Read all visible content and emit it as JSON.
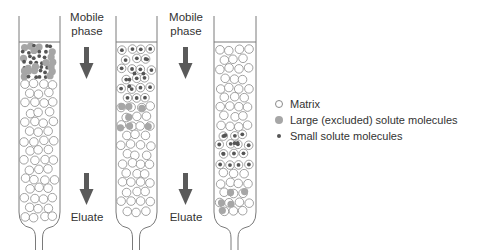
{
  "colors": {
    "outline": "#7a7a7a",
    "matrix_stroke": "#8a8a8a",
    "large_fill": "#a6a6a6",
    "small_fill": "#555555",
    "arrow": "#5a5a5a",
    "text": "#333333"
  },
  "arrows": [
    {
      "label": "Mobile phase",
      "label_lines": [
        "Mobile",
        "phase"
      ],
      "direction": "down",
      "position": "top"
    },
    {
      "label": "Eluate",
      "label_lines": [
        "Eluate"
      ],
      "direction": "down",
      "position": "bottom"
    },
    {
      "label": "Mobile phase",
      "label_lines": [
        "Mobile",
        "phase"
      ],
      "direction": "down",
      "position": "top"
    },
    {
      "label": "Eluate",
      "label_lines": [
        "Eluate"
      ],
      "direction": "down",
      "position": "bottom"
    }
  ],
  "columns": [
    {
      "stage": "sample applied",
      "bands": [
        {
          "type": "mixed",
          "contents": [
            "large",
            "small"
          ],
          "location": "top"
        }
      ]
    },
    {
      "stage": "separation begins",
      "bands": [
        {
          "type": "small-in-matrix",
          "contents": [
            "small"
          ],
          "location": "upper"
        },
        {
          "type": "large",
          "contents": [
            "large"
          ],
          "location": "upper-middle"
        }
      ]
    },
    {
      "stage": "separated",
      "bands": [
        {
          "type": "small-in-matrix",
          "contents": [
            "small"
          ],
          "location": "middle"
        },
        {
          "type": "large",
          "contents": [
            "large"
          ],
          "location": "bottom"
        }
      ]
    }
  ],
  "legend": [
    {
      "key": "matrix",
      "label": "Matrix"
    },
    {
      "key": "large",
      "label": "Large (excluded) solute molecules"
    },
    {
      "key": "small",
      "label": "Small solute molecules"
    }
  ]
}
